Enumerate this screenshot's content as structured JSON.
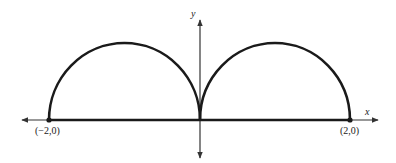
{
  "diagram": {
    "axes": {
      "x_label": "x",
      "y_label": "y"
    },
    "points": [
      {
        "label": "(−2,0)",
        "x": -2,
        "y": 0
      },
      {
        "label": "(2,0)",
        "x": 2,
        "y": 0
      }
    ],
    "curves": [
      {
        "type": "semicircle",
        "center": [
          -1,
          0
        ],
        "radius": 1,
        "upper": true
      },
      {
        "type": "semicircle",
        "center": [
          1,
          0
        ],
        "radius": 1,
        "upper": true
      },
      {
        "type": "segment",
        "from": [
          -2,
          0
        ],
        "to": [
          2,
          0
        ]
      }
    ],
    "colors": {
      "stroke": "#1a1a1a",
      "axis": "#333333",
      "background": "#ffffff"
    }
  }
}
